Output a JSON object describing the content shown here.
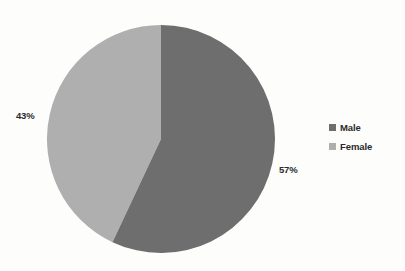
{
  "chart_data": {
    "type": "pie",
    "title": "",
    "subtitle": "",
    "xlabel": "",
    "ylabel": "",
    "grid": false,
    "legend_position": "right",
    "start_angle_deg": 0,
    "direction": "clockwise",
    "categories": [
      "Male",
      "Female"
    ],
    "values": [
      57,
      43
    ],
    "unit": "%",
    "slices": [
      {
        "label": "Male",
        "value": 57,
        "data_label": "57%",
        "color": "#6e6e6e",
        "start_deg": 0,
        "end_deg": 205.2
      },
      {
        "label": "Female",
        "value": 43,
        "data_label": "43%",
        "color": "#afafaf",
        "start_deg": 205.2,
        "end_deg": 360
      }
    ],
    "annotations": [
      "43%",
      "57%"
    ]
  },
  "legend": {
    "items": [
      {
        "label": "Male",
        "swatch_color": "#6e6e6e"
      },
      {
        "label": "Female",
        "swatch_color": "#afafaf"
      }
    ]
  },
  "labels": {
    "female_pct": "43%",
    "male_pct": "57%"
  },
  "colors": {
    "male": "#6e6e6e",
    "female": "#afafaf",
    "text": "#2b2b2b",
    "background": "#fefefe"
  }
}
